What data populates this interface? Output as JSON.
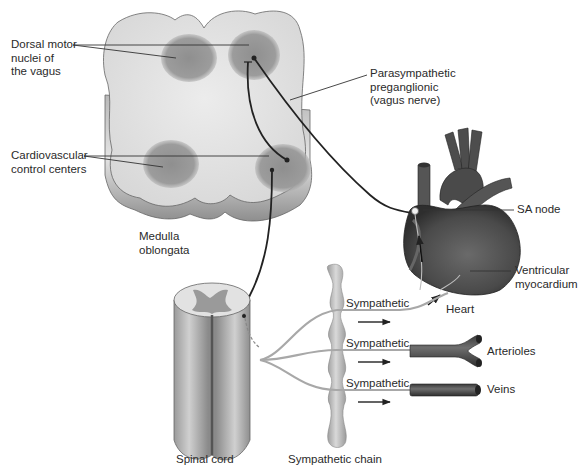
{
  "diagram": {
    "structures": {
      "medulla": "Medulla\noblongata",
      "spinal_cord": "Spinal cord",
      "sympathetic_chain": "Sympathetic chain",
      "heart": "Heart"
    },
    "labels": {
      "dorsal_motor": "Dorsal motor\nnuclei of\nthe vagus",
      "cardiovascular": "Cardiovascular\ncontrol centers",
      "parasympathetic": "Parasympathetic\npreganglionic\n(vagus nerve)",
      "sa_node": "SA node",
      "ventricular": "Ventricular\nmyocardium",
      "arterioles": "Arterioles",
      "veins": "Veins"
    },
    "pathways": [
      {
        "label": "Sympathetic",
        "target": "Heart"
      },
      {
        "label": "Sympathetic",
        "target": "Arterioles"
      },
      {
        "label": "Sympathetic",
        "target": "Veins"
      }
    ],
    "colors": {
      "tissue_light": "#e6e6e6",
      "nuclei": "#9a9a9a",
      "heart": "#4a4a4a",
      "nerve": "#2a2a2a",
      "sympathetic_fiber": "#a8a8a8"
    }
  }
}
